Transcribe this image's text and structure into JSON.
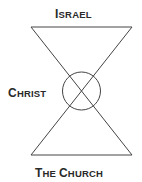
{
  "diagram": {
    "labels": {
      "top": {
        "first": "I",
        "rest": "SRAEL"
      },
      "left": {
        "first": "C",
        "rest": "HRIST"
      },
      "bottom": {
        "w1_first": "T",
        "w1_rest": "HE ",
        "w2_first": "C",
        "w2_rest": "HURCH"
      }
    },
    "shapes": {
      "top_triangle": "inverted triangle (Israel)",
      "bottom_triangle": "upright triangle (The Church)",
      "center_circle": "circle at apex intersection (Christ)"
    },
    "colors": {
      "line": "#444444",
      "text": "#2a2a2a",
      "background": "#ffffff"
    }
  }
}
